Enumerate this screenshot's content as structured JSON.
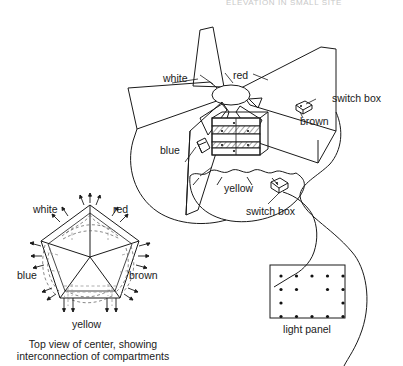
{
  "page": {
    "header_fragment": "ELEVATION IN SMALL SITE",
    "background": "#ffffff",
    "ink": "#1a1a1a"
  },
  "perspective_view": {
    "name": "exploded perspective of pentagonal compartment center",
    "labels": {
      "white": "white",
      "red": "red",
      "blue": "blue",
      "brown": "brown",
      "yellow": "yellow",
      "switch_box_right": "switch box",
      "switch_box_bottom": "switch box"
    }
  },
  "pentagon_diagram": {
    "labels": {
      "white": "white",
      "red": "red",
      "blue": "blue",
      "brown": "brown",
      "yellow": "yellow"
    },
    "caption_line1": "Top view of center, showing",
    "caption_line2": "interconnection of compartments"
  },
  "light_panel": {
    "label": "light panel",
    "rows": [
      [
        1,
        1,
        1,
        1,
        1
      ],
      [
        1,
        1,
        0,
        1,
        1
      ],
      [
        1,
        0,
        0,
        0,
        1
      ],
      [
        1,
        1,
        1,
        1,
        1
      ]
    ]
  }
}
